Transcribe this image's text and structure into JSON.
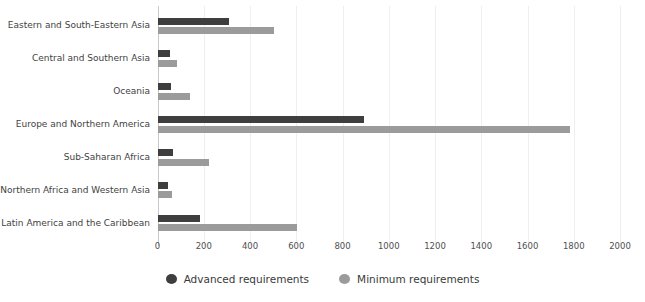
{
  "chart_data": {
    "type": "bar",
    "orientation": "horizontal",
    "title": "",
    "xlabel": "",
    "ylabel": "",
    "xlim": [
      0,
      2000
    ],
    "x_ticks": [
      0,
      200,
      400,
      600,
      800,
      1000,
      1200,
      1400,
      1600,
      1800,
      2000
    ],
    "grid": "vertical-light",
    "legend_position": "bottom-center",
    "categories": [
      "Eastern and South-Eastern Asia",
      "Central and Southern Asia",
      "Oceania",
      "Europe and Northern America",
      "Sub-Saharan Africa",
      "Northern Africa and Western Asia",
      "Latin America and the Caribbean"
    ],
    "series": [
      {
        "name": "Advanced requirements",
        "color": "#3e3e3e",
        "values": [
          305,
          50,
          55,
          890,
          65,
          45,
          180
        ]
      },
      {
        "name": "Minimum requirements",
        "color": "#9b9b9b",
        "values": [
          500,
          80,
          140,
          1780,
          220,
          60,
          600
        ]
      }
    ],
    "colors": {
      "grid": "#efefef",
      "axis": "#c9c9c9",
      "label_text": "#3f3f3f",
      "tick_text": "#4f4f4f"
    }
  }
}
